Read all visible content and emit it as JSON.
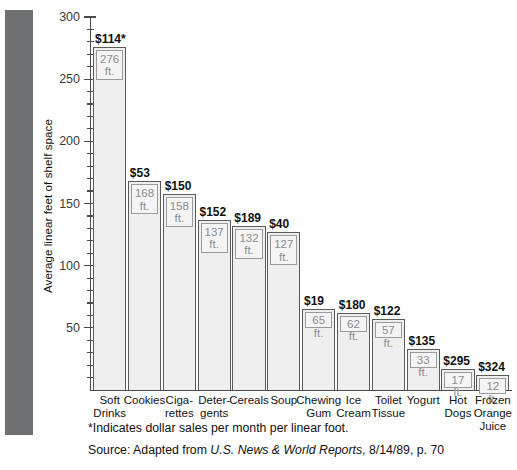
{
  "chart_data": {
    "type": "bar",
    "title": "",
    "xlabel": "",
    "ylabel": "Average linear feet of shelf space",
    "ylim": [
      0,
      300
    ],
    "ytick_labels": [
      "300",
      "250",
      "200",
      "150",
      "100",
      "50"
    ],
    "ytick_values": [
      300,
      250,
      200,
      150,
      100,
      50
    ],
    "minor_tick_interval": 10,
    "grid": false,
    "legend": "none",
    "categories": [
      "Soft\nDrinks",
      "Cookies",
      "Ciga-\nrettes",
      "Deter-\ngents",
      "Cereals",
      "Soup",
      "Chewing\nGum",
      "Ice\nCream",
      "Toilet\nTissue",
      "Yogurt",
      "Hot\nDogs",
      "Frozen\nOrange\nJuice"
    ],
    "values": [
      276,
      168,
      158,
      137,
      132,
      127,
      65,
      62,
      57,
      33,
      17,
      12
    ],
    "bar_inner_labels": [
      "276\nft.",
      "168\nft.",
      "158\nft.",
      "137\nft.",
      "132\nft.",
      "127\nft.",
      "65 ft.",
      "62 ft.",
      "57 ft.",
      "33 ft.",
      "17 ft.",
      "12 ft."
    ],
    "dollar_labels": [
      "$114*",
      "$53",
      "$150",
      "$152",
      "$189",
      "$40",
      "$19",
      "$180",
      "$122",
      "$135",
      "$295",
      "$324"
    ],
    "dollar_values": [
      114,
      53,
      150,
      152,
      189,
      40,
      19,
      180,
      122,
      135,
      295,
      324
    ],
    "series": [
      {
        "name": "Average linear feet of shelf space",
        "values": [
          276,
          168,
          158,
          137,
          132,
          127,
          65,
          62,
          57,
          33,
          17,
          12
        ]
      },
      {
        "name": "Dollar sales per month per linear foot",
        "values": [
          114,
          53,
          150,
          152,
          189,
          40,
          19,
          180,
          122,
          135,
          295,
          324
        ]
      }
    ]
  },
  "notes": {
    "footnote": "*Indicates dollar sales per month per linear foot.",
    "source_prefix": "Source: Adapted from ",
    "source_publication": "U.S. News & World Reports",
    "source_suffix": ", 8/14/89, p. 70"
  },
  "colors": {
    "band": "#6f7072",
    "bar_fill": "#efeff0",
    "bar_border": "#5a5a5c",
    "inner_text": "#8d8d90",
    "axis": "#4b4b4b",
    "text": "#111111"
  }
}
